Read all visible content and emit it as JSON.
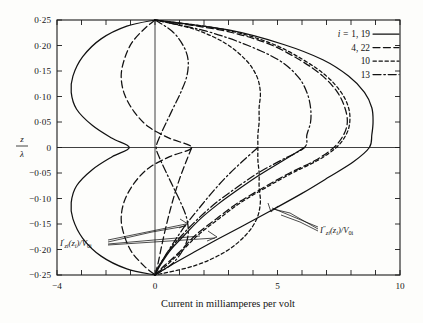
{
  "chart_data": {
    "type": "line",
    "title": "",
    "xlabel": "Current in milliamperes per volt",
    "ylabel": "z/λ",
    "ylabel_numerator": "z",
    "ylabel_denominator": "λ",
    "xlim": [
      -4,
      10
    ],
    "ylim": [
      -0.25,
      0.25
    ],
    "xticks": [
      -4,
      -3,
      -2,
      -1,
      0,
      1,
      2,
      3,
      4,
      5,
      6,
      7,
      8,
      9,
      10
    ],
    "xtick_labels": [
      "−4",
      "",
      "",
      "",
      "0",
      "",
      "",
      "",
      "",
      "5",
      "",
      "",
      "",
      "",
      "10"
    ],
    "yticks": [
      0.25,
      0.2,
      0.15,
      0.1,
      0.05,
      0,
      -0.05,
      -0.1,
      -0.15,
      -0.2,
      -0.25
    ],
    "ytick_labels": [
      "0·25",
      "0·20",
      "0·15",
      "0·10",
      "0·05",
      "0",
      "−0·05",
      "−0·10",
      "−0·15",
      "−0·20",
      "−0·25"
    ],
    "grid": false,
    "legend_position": "top-right",
    "legend_prefix": "i = ",
    "legend": [
      {
        "label": "1, 19",
        "style": "solid"
      },
      {
        "label": "4, 22",
        "style": "dashed"
      },
      {
        "label": "10",
        "style": "dotted"
      },
      {
        "label": "13",
        "style": "dashdot"
      }
    ],
    "annotations": [
      {
        "text_html": "I′<sub>zi</sub>(z<sub>i</sub>)/V<sub>0i</sub>",
        "text": "I'zi(zi)/V0i",
        "x": -2.4,
        "y": -0.201
      },
      {
        "text_html": "I″<sub>zi</sub>(z<sub>i</sub>)/V<sub>0i</sub>",
        "text": "I''zi(zi)/V0i",
        "x": 6.35,
        "y": -0.152
      }
    ],
    "series": [
      {
        "name": "i = 1, 19 (left lobe)",
        "style": "solid",
        "points": [
          [
            0,
            0.25
          ],
          [
            -1.15,
            0.238
          ],
          [
            -2.2,
            0.213
          ],
          [
            -2.95,
            0.178
          ],
          [
            -3.35,
            0.14
          ],
          [
            -3.42,
            0.108
          ],
          [
            -3.2,
            0.075
          ],
          [
            -2.55,
            0.043
          ],
          [
            -1.75,
            0.018
          ],
          [
            -1.05,
            0.0
          ],
          [
            -1.75,
            -0.018
          ],
          [
            -2.55,
            -0.043
          ],
          [
            -3.2,
            -0.075
          ],
          [
            -3.42,
            -0.108
          ],
          [
            -3.35,
            -0.14
          ],
          [
            -2.95,
            -0.178
          ],
          [
            -2.2,
            -0.213
          ],
          [
            -1.15,
            -0.238
          ],
          [
            0,
            -0.25
          ]
        ]
      },
      {
        "name": "i = 4, 22 (left lobe)",
        "style": "dashed",
        "points": [
          [
            0,
            0.25
          ],
          [
            -0.45,
            0.232
          ],
          [
            -0.95,
            0.205
          ],
          [
            -1.25,
            0.173
          ],
          [
            -1.38,
            0.14
          ],
          [
            -1.25,
            0.105
          ],
          [
            -0.85,
            0.07
          ],
          [
            -0.25,
            0.04
          ],
          [
            0.6,
            0.018
          ],
          [
            1.5,
            0.0
          ],
          [
            0.6,
            -0.018
          ],
          [
            -0.25,
            -0.04
          ],
          [
            -0.85,
            -0.07
          ],
          [
            -1.25,
            -0.105
          ],
          [
            -1.38,
            -0.14
          ],
          [
            -1.25,
            -0.173
          ],
          [
            -0.95,
            -0.205
          ],
          [
            -0.45,
            -0.232
          ],
          [
            0,
            -0.25
          ]
        ]
      },
      {
        "name": "i = 13 (mid lobe)",
        "style": "dashdot",
        "points": [
          [
            0,
            0.25
          ],
          [
            0.7,
            0.228
          ],
          [
            1.15,
            0.2
          ],
          [
            1.35,
            0.172
          ],
          [
            1.3,
            0.14
          ],
          [
            1.05,
            0.108
          ],
          [
            0.75,
            0.078
          ],
          [
            0.45,
            0.048
          ],
          [
            0.2,
            0.022
          ],
          [
            0.05,
            0.0
          ],
          [
            0.2,
            -0.022
          ],
          [
            0.45,
            -0.048
          ],
          [
            0.75,
            -0.078
          ],
          [
            1.05,
            -0.108
          ],
          [
            1.3,
            -0.14
          ],
          [
            1.35,
            -0.172
          ],
          [
            1.15,
            -0.2
          ],
          [
            0.7,
            -0.228
          ],
          [
            0,
            -0.25
          ]
        ]
      },
      {
        "name": "i = 10 (mid-right lobe)",
        "style": "dotted",
        "points": [
          [
            0,
            0.25
          ],
          [
            1.6,
            0.232
          ],
          [
            2.85,
            0.205
          ],
          [
            3.7,
            0.172
          ],
          [
            4.15,
            0.14
          ],
          [
            4.3,
            0.108
          ],
          [
            4.25,
            0.078
          ],
          [
            4.25,
            0.05
          ],
          [
            4.2,
            0.025
          ],
          [
            4.2,
            0.0
          ],
          [
            4.2,
            -0.025
          ],
          [
            4.25,
            -0.05
          ],
          [
            4.25,
            -0.078
          ],
          [
            4.3,
            -0.108
          ],
          [
            4.15,
            -0.14
          ],
          [
            3.7,
            -0.172
          ],
          [
            2.85,
            -0.205
          ],
          [
            1.6,
            -0.232
          ],
          [
            0,
            -0.25
          ]
        ]
      },
      {
        "name": "i = 13 (right lobe)",
        "style": "dashdot",
        "points": [
          [
            0,
            0.25
          ],
          [
            2.1,
            0.228
          ],
          [
            3.8,
            0.2
          ],
          [
            5.1,
            0.17
          ],
          [
            5.85,
            0.138
          ],
          [
            6.2,
            0.108
          ],
          [
            6.35,
            0.078
          ],
          [
            6.35,
            0.05
          ],
          [
            6.2,
            0.025
          ],
          [
            6.1,
            0.0
          ],
          [
            5.15,
            -0.025
          ],
          [
            4.2,
            -0.05
          ],
          [
            3.35,
            -0.078
          ],
          [
            2.5,
            -0.108
          ],
          [
            1.75,
            -0.14
          ],
          [
            1.1,
            -0.172
          ],
          [
            0.6,
            -0.2
          ],
          [
            0.22,
            -0.228
          ],
          [
            0,
            -0.25
          ]
        ]
      },
      {
        "name": "i = 4, 22 (right lobe)",
        "style": "dashed",
        "points": [
          [
            0,
            0.25
          ],
          [
            2.7,
            0.23
          ],
          [
            4.55,
            0.205
          ],
          [
            5.9,
            0.172
          ],
          [
            6.85,
            0.14
          ],
          [
            7.45,
            0.108
          ],
          [
            7.75,
            0.078
          ],
          [
            7.85,
            0.05
          ],
          [
            7.7,
            0.025
          ],
          [
            7.3,
            0.0
          ],
          [
            6.55,
            -0.025
          ],
          [
            5.5,
            -0.05
          ],
          [
            4.45,
            -0.078
          ],
          [
            3.4,
            -0.108
          ],
          [
            2.5,
            -0.14
          ],
          [
            1.65,
            -0.172
          ],
          [
            1.0,
            -0.205
          ],
          [
            0.42,
            -0.23
          ],
          [
            0,
            -0.25
          ]
        ]
      },
      {
        "name": "i = 10 (right lobe)",
        "style": "dotted",
        "points": [
          [
            0,
            0.25
          ],
          [
            2.75,
            0.232
          ],
          [
            4.7,
            0.205
          ],
          [
            6.05,
            0.172
          ],
          [
            7.0,
            0.14
          ],
          [
            7.6,
            0.108
          ],
          [
            7.9,
            0.078
          ],
          [
            7.95,
            0.05
          ],
          [
            7.8,
            0.025
          ],
          [
            7.4,
            0.0
          ],
          [
            6.65,
            -0.025
          ],
          [
            5.6,
            -0.05
          ],
          [
            4.55,
            -0.078
          ],
          [
            3.5,
            -0.108
          ],
          [
            2.6,
            -0.14
          ],
          [
            1.75,
            -0.172
          ],
          [
            1.05,
            -0.205
          ],
          [
            0.45,
            -0.232
          ],
          [
            0,
            -0.25
          ]
        ]
      },
      {
        "name": "i = 1, 19 (right lobe)",
        "style": "solid",
        "points": [
          [
            0,
            0.25
          ],
          [
            3.05,
            0.23
          ],
          [
            5.25,
            0.202
          ],
          [
            6.85,
            0.172
          ],
          [
            7.9,
            0.14
          ],
          [
            8.55,
            0.108
          ],
          [
            8.85,
            0.078
          ],
          [
            8.9,
            0.05
          ],
          [
            8.85,
            0.025
          ],
          [
            8.75,
            0.0
          ],
          [
            8.1,
            -0.028
          ],
          [
            7.1,
            -0.058
          ],
          [
            6.0,
            -0.09
          ],
          [
            4.8,
            -0.122
          ],
          [
            3.65,
            -0.152
          ],
          [
            2.55,
            -0.18
          ],
          [
            1.6,
            -0.205
          ],
          [
            0.75,
            -0.228
          ],
          [
            0,
            -0.25
          ]
        ]
      },
      {
        "name": "i = 1, 19 (inner right, lower)",
        "style": "solid",
        "points": [
          [
            6.1,
            0.0
          ],
          [
            5.15,
            -0.028
          ],
          [
            4.2,
            -0.056
          ],
          [
            3.35,
            -0.084
          ],
          [
            2.55,
            -0.112
          ],
          [
            1.85,
            -0.14
          ],
          [
            1.2,
            -0.172
          ],
          [
            0.65,
            -0.2
          ],
          [
            0.25,
            -0.228
          ],
          [
            0,
            -0.25
          ]
        ]
      },
      {
        "name": "i = 4, 22 (inner left, lower)",
        "style": "dashed",
        "points": [
          [
            1.5,
            0.0
          ],
          [
            1.25,
            -0.03
          ],
          [
            1.0,
            -0.062
          ],
          [
            0.78,
            -0.095
          ],
          [
            0.58,
            -0.13
          ],
          [
            0.4,
            -0.165
          ],
          [
            0.25,
            -0.198
          ],
          [
            0.12,
            -0.228
          ],
          [
            0,
            -0.25
          ]
        ]
      },
      {
        "name": "i = 13 (inner left, lower)",
        "style": "dashdot",
        "points": [
          [
            4.2,
            0.0
          ],
          [
            3.55,
            -0.028
          ],
          [
            2.9,
            -0.058
          ],
          [
            2.3,
            -0.09
          ],
          [
            1.75,
            -0.122
          ],
          [
            1.25,
            -0.152
          ],
          [
            0.82,
            -0.182
          ],
          [
            0.42,
            -0.212
          ],
          [
            0.12,
            -0.236
          ],
          [
            0,
            -0.25
          ]
        ]
      }
    ]
  },
  "legend_block": {
    "prefix": "i = ",
    "rows": [
      {
        "label": "1, 19"
      },
      {
        "label": "4, 22"
      },
      {
        "label": "10"
      },
      {
        "label": "13"
      }
    ]
  },
  "axes": {
    "x_title": "Current in milliamperes per volt",
    "y_num": "z",
    "y_den": "λ",
    "x_labels": [
      {
        "v": -4,
        "t": "−4"
      },
      {
        "v": 0,
        "t": "0"
      },
      {
        "v": 5,
        "t": "5"
      },
      {
        "v": 10,
        "t": "10"
      }
    ],
    "y_labels": [
      {
        "v": 0.25,
        "t": "0·25"
      },
      {
        "v": 0.2,
        "t": "0·20"
      },
      {
        "v": 0.15,
        "t": "0·15"
      },
      {
        "v": 0.1,
        "t": "0·10"
      },
      {
        "v": 0.05,
        "t": "0·05"
      },
      {
        "v": 0.0,
        "t": "0"
      },
      {
        "v": -0.05,
        "t": "−0·05"
      },
      {
        "v": -0.1,
        "t": "−0·10"
      },
      {
        "v": -0.15,
        "t": "−0·15"
      },
      {
        "v": -0.2,
        "t": "−0·20"
      },
      {
        "v": -0.25,
        "t": "−0·25"
      }
    ]
  },
  "annotation_left": {
    "main": "I",
    "prime": "′",
    "sub1": "zi",
    "mid": "(z",
    "sub2": "i",
    "tail": ")/V",
    "sub3": "0i"
  },
  "annotation_right": {
    "main": "I",
    "prime": "″",
    "sub1": "zi",
    "mid": "(z",
    "sub2": "i",
    "tail": ")/V",
    "sub3": "0i"
  },
  "colors": {
    "curve": "#111111",
    "axis": "#1a1a1a",
    "background": "#fdfdfb"
  }
}
